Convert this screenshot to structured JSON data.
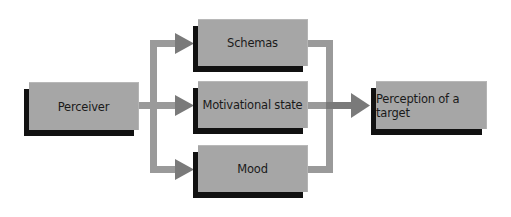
{
  "diagram": {
    "type": "flowchart",
    "colors": {
      "box_fill": "#a6a6a6",
      "box_shadow": "#111111",
      "arrow": "#7a7a7a",
      "connector": "#9a9a9a",
      "background": "#ffffff"
    },
    "nodes": {
      "perceiver": "Perceiver",
      "schemas": "Schemas",
      "motivational_state": "Motivational state",
      "mood": "Mood",
      "perception": "Perception of a target"
    },
    "edges": [
      {
        "from": "Perceiver",
        "to": "Schemas"
      },
      {
        "from": "Perceiver",
        "to": "Motivational state"
      },
      {
        "from": "Perceiver",
        "to": "Mood"
      },
      {
        "from": "Schemas",
        "to": "Perception of a target"
      },
      {
        "from": "Motivational state",
        "to": "Perception of a target"
      },
      {
        "from": "Mood",
        "to": "Perception of a target"
      }
    ]
  }
}
